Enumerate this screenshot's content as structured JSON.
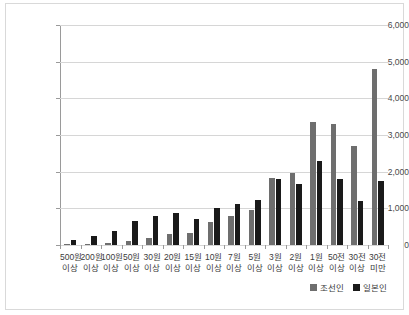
{
  "chart_data": {
    "type": "bar",
    "title": "",
    "xlabel": "",
    "ylabel": "",
    "ylim": [
      0,
      6000
    ],
    "ytick_values": [
      0,
      1000,
      2000,
      3000,
      4000,
      5000,
      6000
    ],
    "ytick_labels": [
      "0",
      "1,000",
      "2,000",
      "3,000",
      "4,000",
      "5,000",
      "6,000"
    ],
    "grid": true,
    "legend_position": "bottom-right",
    "categories": [
      "500원 이상",
      "200원 이상",
      "100원 이상",
      "50원 이상",
      "30원 이상",
      "20원 이상",
      "15원 이상",
      "10원 이상",
      "7원 이상",
      "5원 이상",
      "3원 이상",
      "2원 이상",
      "1원 이상",
      "50전 이상",
      "30전 이상",
      "30전 미만"
    ],
    "category_lines": [
      [
        "500원",
        "이상"
      ],
      [
        "200원",
        "이상"
      ],
      [
        "100원",
        "이상"
      ],
      [
        "50원",
        "이상"
      ],
      [
        "30원",
        "이상"
      ],
      [
        "20원",
        "이상"
      ],
      [
        "15원",
        "이상"
      ],
      [
        "10원",
        "이상"
      ],
      [
        "7원",
        "이상"
      ],
      [
        "5원",
        "이상"
      ],
      [
        "3원",
        "이상"
      ],
      [
        "2원",
        "이상"
      ],
      [
        "1원",
        "이상"
      ],
      [
        "50전",
        "이상"
      ],
      [
        "30전",
        "이상"
      ],
      [
        "30전",
        "미만"
      ]
    ],
    "series": [
      {
        "name": "조선인",
        "color": "#6e6e6e",
        "values": [
          30,
          40,
          60,
          120,
          190,
          290,
          340,
          620,
          800,
          950,
          1820,
          1960,
          3350,
          3300,
          2700,
          4800
        ]
      },
      {
        "name": "일본인",
        "color": "#1a1a1a",
        "values": [
          130,
          250,
          390,
          660,
          800,
          860,
          720,
          1000,
          1120,
          1240,
          1800,
          1670,
          2300,
          1800,
          1200,
          1740
        ]
      }
    ]
  },
  "legend": {
    "items": [
      {
        "label": "조선인",
        "color": "#6e6e6e"
      },
      {
        "label": "일본인",
        "color": "#1a1a1a"
      }
    ]
  }
}
